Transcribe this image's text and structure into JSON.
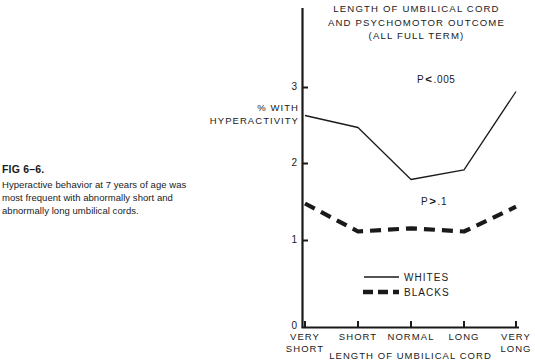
{
  "caption": {
    "label": "FIG 6–6.",
    "text": "Hyperactive behavior at 7 years of age was most frequent with abnormally short and abnormally long umbilical cords."
  },
  "chart_data": {
    "type": "line",
    "title": "LENGTH OF UMBILICAL CORD AND PSYCHOMOTOR OUTCOME (ALL FULL TERM)",
    "title_lines": [
      "LENGTH OF UMBILICAL CORD",
      "AND PSYCHOMOTOR OUTCOME",
      "(ALL FULL TERM)"
    ],
    "ylabel": "% WITH HYPERACTIVITY",
    "ylabel_lines": [
      "% WITH",
      "HYPERACTIVITY"
    ],
    "xlabel": "LENGTH OF UMBILICAL CORD",
    "categories": [
      "VERY SHORT",
      "SHORT",
      "NORMAL",
      "LONG",
      "VERY LONG"
    ],
    "category_lines": [
      [
        "VERY",
        "SHORT"
      ],
      [
        "SHORT",
        ""
      ],
      [
        "NORMAL",
        ""
      ],
      [
        "LONG",
        ""
      ],
      [
        "VERY",
        "LONG"
      ]
    ],
    "ylim": [
      0,
      3
    ],
    "yticks": [
      0,
      1,
      2,
      3
    ],
    "ytick_labels": [
      "0",
      "1",
      "2",
      "3"
    ],
    "grid": false,
    "legend_position": "inside-bottom-center",
    "series": [
      {
        "name": "WHITES",
        "style": "solid",
        "color": "#1a1a1a",
        "values": [
          2.65,
          2.5,
          1.85,
          1.97,
          2.95
        ]
      },
      {
        "name": "BLACKS",
        "style": "dashed",
        "color": "#1a1a1a",
        "values": [
          1.55,
          1.2,
          1.24,
          1.2,
          1.51
        ]
      }
    ],
    "annotations": [
      {
        "id": "pval-whites",
        "text": "P < .005",
        "prefix": "P",
        "operator": "<",
        "value": ".005",
        "series": "WHITES"
      },
      {
        "id": "pval-blacks",
        "text": "P > .1",
        "prefix": "P",
        "operator": ">",
        "value": ".1",
        "series": "BLACKS"
      }
    ]
  },
  "legend": {
    "whites": "WHITES",
    "blacks": "BLACKS"
  },
  "axis": {
    "ytick_0": "0",
    "ytick_1": "1",
    "ytick_2": "2",
    "ytick_3": "3"
  },
  "xticks": {
    "t0_line1": "VERY",
    "t0_line2": "SHORT",
    "t1_line1": "SHORT",
    "t1_line2": "",
    "t2_line1": "NORMAL",
    "t2_line2": "",
    "t3_line1": "LONG",
    "t3_line2": "",
    "t4_line1": "VERY",
    "t4_line2": "LONG"
  },
  "pvalues": {
    "whites_prefix": "P",
    "whites_op": "<",
    "whites_val": ".005",
    "blacks_prefix": "P",
    "blacks_op": ">",
    "blacks_val": ".1"
  },
  "title": {
    "line1": "LENGTH OF UMBILICAL CORD",
    "line2": "AND PSYCHOMOTOR OUTCOME",
    "line3": "(ALL FULL TERM)"
  },
  "ylabel": {
    "line1": "% WITH",
    "line2": "HYPERACTIVITY"
  },
  "xlabel": {
    "text": "LENGTH OF UMBILICAL CORD"
  },
  "colors": {
    "ink": "#1a1a1a",
    "background": "#ffffff"
  }
}
